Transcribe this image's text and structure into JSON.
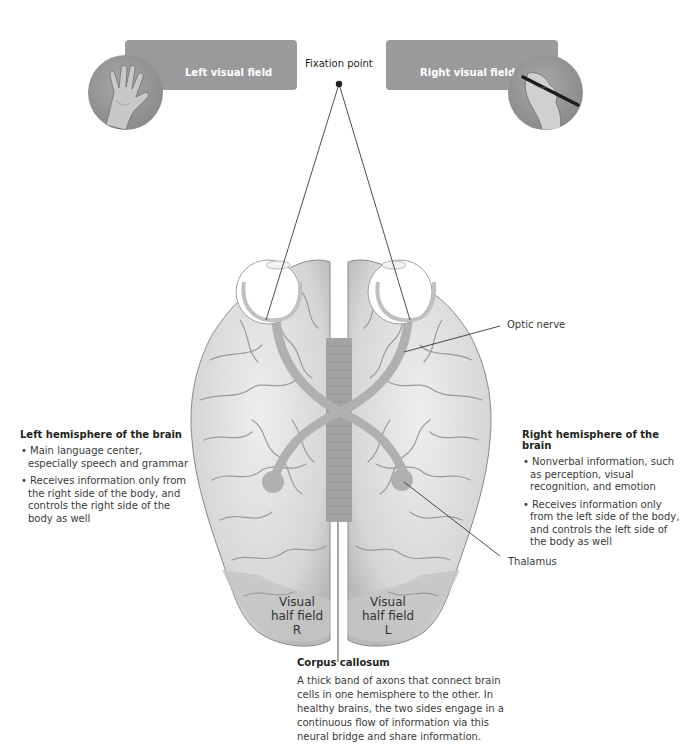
{
  "visual_fields": {
    "left": {
      "label": "Left visual field",
      "image": "hand-resting-icon"
    },
    "right": {
      "label": "Right visual field",
      "image": "hand-writing-icon"
    }
  },
  "fixation": {
    "label": "Fixation point"
  },
  "callouts": {
    "optic_nerve": "Optic nerve",
    "thalamus": "Thalamus"
  },
  "half_fields": {
    "right": {
      "line1": "Visual",
      "line2": "half field",
      "line3": "R"
    },
    "left": {
      "line1": "Visual",
      "line2": "half field",
      "line3": "L"
    }
  },
  "left_hemisphere": {
    "title": "Left hemisphere of the brain",
    "bullets": [
      "Main language center, especially speech and grammar",
      "Receives information only from the right side of the body, and controls the right side of the body as well"
    ]
  },
  "right_hemisphere": {
    "title": "Right hemisphere of the brain",
    "bullets": [
      "Nonverbal information, such as perception, visual recognition, and emotion",
      "Receives information only from the left side of the body, and controls the left side of the body as well"
    ]
  },
  "corpus_callosum": {
    "title": "Corpus callosum",
    "text": "A thick band of axons that connect brain cells in one hemisphere to the other. In healthy brains, the two sides engage in a continuous flow of information via this neural bridge and share information."
  },
  "colors": {
    "field_box": "#999a9b",
    "brain_fill": "#dcdcdc",
    "brain_shadow": "#b5b5b5",
    "optic_path": "#b0b0b0",
    "corpus_callosum": "#a3a3a3"
  }
}
